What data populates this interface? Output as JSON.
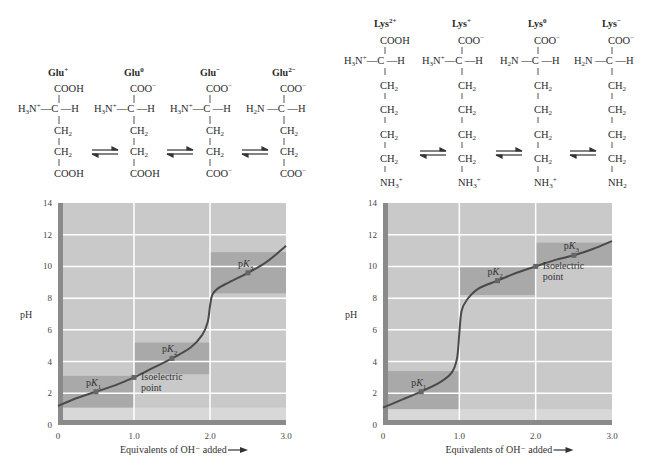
{
  "glutamate": {
    "species": [
      {
        "name": "Glu",
        "charge": "+",
        "top": "COOH",
        "amino": "H3N+",
        "side": [
          "CH2",
          "CH2"
        ],
        "end": "COOH"
      },
      {
        "name": "Glu",
        "charge": "0",
        "top": "COO−",
        "amino": "H3N+",
        "side": [
          "CH2",
          "CH2"
        ],
        "end": "COOH"
      },
      {
        "name": "Glu",
        "charge": "−",
        "top": "COO−",
        "amino": "H3N+",
        "side": [
          "CH2",
          "CH2"
        ],
        "end": "COO−"
      },
      {
        "name": "Glu",
        "charge": "2−",
        "top": "COO−",
        "amino": "H2N",
        "side": [
          "CH2",
          "CH2"
        ],
        "end": "COO−"
      }
    ]
  },
  "lysine": {
    "species": [
      {
        "name": "Lys",
        "charge": "2+",
        "top": "COOH",
        "amino": "H3N+",
        "side": [
          "CH2",
          "CH2",
          "CH2",
          "CH2"
        ],
        "end": "NH3+"
      },
      {
        "name": "Lys",
        "charge": "+",
        "top": "COO−",
        "amino": "H3N+",
        "side": [
          "CH2",
          "CH2",
          "CH2",
          "CH2"
        ],
        "end": "NH3+"
      },
      {
        "name": "Lys",
        "charge": "0",
        "top": "COO−",
        "amino": "H2N",
        "side": [
          "CH2",
          "CH2",
          "CH2",
          "CH2"
        ],
        "end": "NH3+"
      },
      {
        "name": "Lys",
        "charge": "−",
        "top": "COO−",
        "amino": "H2N",
        "side": [
          "CH2",
          "CH2",
          "CH2",
          "CH2"
        ],
        "end": "NH2"
      }
    ]
  },
  "chart_data": [
    {
      "type": "line",
      "title": "Glutamic acid titration curve",
      "xlabel": "Equivalents of OH⁻ added",
      "ylabel": "pH",
      "xlim": [
        0,
        3.0
      ],
      "ylim": [
        0,
        14
      ],
      "x_ticks": [
        "0",
        "1.0",
        "2.0",
        "3.0"
      ],
      "y_ticks": [
        "0",
        "2",
        "4",
        "6",
        "8",
        "10",
        "12",
        "14"
      ],
      "grid": true,
      "x": [
        0,
        0.25,
        0.5,
        0.75,
        1.0,
        1.25,
        1.5,
        1.75,
        1.9,
        1.97,
        2.0,
        2.03,
        2.1,
        2.25,
        2.5,
        2.75,
        3.0
      ],
      "y": [
        1.2,
        1.7,
        2.1,
        2.5,
        3.0,
        3.6,
        4.2,
        4.9,
        5.7,
        6.5,
        7.5,
        8.2,
        8.6,
        9.0,
        9.6,
        10.3,
        11.3
      ],
      "annotations": [
        {
          "label": "pK1",
          "x": 0.5,
          "y": 2.1
        },
        {
          "label": "Isoelectric point",
          "x": 1.0,
          "y": 3.0
        },
        {
          "label": "pK2",
          "x": 1.5,
          "y": 4.2
        },
        {
          "label": "pK3",
          "x": 2.5,
          "y": 9.6
        }
      ],
      "buffer_bands": [
        {
          "x": [
            0,
            1.0
          ],
          "y": [
            1.1,
            3.1
          ]
        },
        {
          "x": [
            1.0,
            2.0
          ],
          "y": [
            3.2,
            5.2
          ]
        },
        {
          "x": [
            2.0,
            3.0
          ],
          "y": [
            8.3,
            10.9
          ]
        }
      ]
    },
    {
      "type": "line",
      "title": "Lysine titration curve",
      "xlabel": "Equivalents of OH⁻ added",
      "ylabel": "pH",
      "xlim": [
        0,
        3.0
      ],
      "ylim": [
        0,
        14
      ],
      "x_ticks": [
        "0",
        "1.0",
        "2.0",
        "3.0"
      ],
      "y_ticks": [
        "0",
        "2",
        "4",
        "6",
        "8",
        "10",
        "12",
        "14"
      ],
      "grid": true,
      "x": [
        0,
        0.25,
        0.5,
        0.75,
        0.9,
        0.97,
        1.0,
        1.03,
        1.1,
        1.25,
        1.5,
        1.75,
        2.0,
        2.25,
        2.5,
        2.75,
        3.0
      ],
      "y": [
        1.1,
        1.6,
        2.1,
        2.7,
        3.3,
        4.2,
        5.8,
        7.2,
        7.9,
        8.6,
        9.1,
        9.6,
        10.0,
        10.4,
        10.7,
        11.1,
        11.6
      ],
      "annotations": [
        {
          "label": "pK1",
          "x": 0.5,
          "y": 2.1
        },
        {
          "label": "pK2",
          "x": 1.5,
          "y": 9.1
        },
        {
          "label": "Isoelectric point",
          "x": 2.0,
          "y": 10.0
        },
        {
          "label": "pK3",
          "x": 2.5,
          "y": 10.7
        }
      ],
      "buffer_bands": [
        {
          "x": [
            0,
            1.0
          ],
          "y": [
            1.0,
            3.4
          ]
        },
        {
          "x": [
            1.0,
            2.0
          ],
          "y": [
            8.2,
            10.0
          ]
        },
        {
          "x": [
            2.0,
            3.0
          ],
          "y": [
            10.0,
            11.5
          ]
        }
      ]
    }
  ],
  "labels": {
    "glu": [
      "Glu",
      "Glu",
      "Glu",
      "Glu"
    ],
    "glu_charge": [
      "+",
      "0",
      "−",
      "2−"
    ],
    "lys": [
      "Lys",
      "Lys",
      "Lys",
      "Lys"
    ],
    "lys_charge": [
      "2+",
      "+",
      "0",
      "−"
    ],
    "ph": "pH",
    "xlabel": "Equivalents of OH⁻ added",
    "pk1": "pK",
    "isoelectric1": "Isoelectric",
    "isoelectric2": "point"
  },
  "colors": {
    "plot_bg": "#c9c9c9",
    "band": "#a9a9a9",
    "axis_bar": "#8a8a8a",
    "grid": "#ffffff",
    "curve": "#4a4a4a",
    "low_band": "#d8d8d8"
  }
}
